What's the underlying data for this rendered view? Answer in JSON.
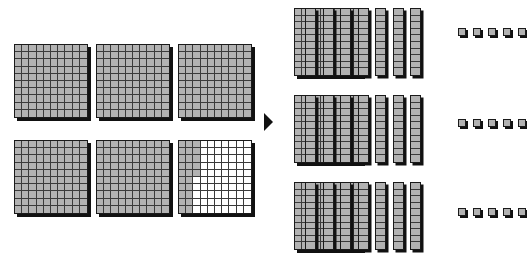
{
  "diagram": {
    "type": "base-ten-blocks-division",
    "colors": {
      "block_fill": "#b2b2b2",
      "block_outline": "#1a1a1a",
      "grid_line": "#3a3a3a",
      "shadow": "#111111",
      "background": "#ffffff",
      "arrow": "#111111"
    },
    "arrow": {
      "icon": "right-triangle-arrow-icon",
      "direction": "right",
      "label": ""
    },
    "left_side": {
      "caption": "",
      "total_value": 525,
      "flats": [
        {
          "index": 1,
          "rows": 10,
          "cols": 10,
          "shaded_cells": 100,
          "value": 100,
          "shading": "full"
        },
        {
          "index": 2,
          "rows": 10,
          "cols": 10,
          "shaded_cells": 100,
          "value": 100,
          "shading": "full"
        },
        {
          "index": 3,
          "rows": 10,
          "cols": 10,
          "shaded_cells": 100,
          "value": 100,
          "shading": "full"
        },
        {
          "index": 4,
          "rows": 10,
          "cols": 10,
          "shaded_cells": 100,
          "value": 100,
          "shading": "full"
        },
        {
          "index": 5,
          "rows": 10,
          "cols": 10,
          "shaded_cells": 100,
          "value": 100,
          "shading": "full"
        },
        {
          "index": 6,
          "rows": 10,
          "cols": 10,
          "shaded_cells": 25,
          "value": 25,
          "shading": "partial",
          "shaded_pattern": "left 2 columns plus 5 cells of third column"
        }
      ]
    },
    "right_side": {
      "caption": "",
      "group_count": 3,
      "group_value": 175,
      "total_value": 525,
      "groups": [
        {
          "index": 1,
          "flats": 1,
          "rods": 7,
          "units": 5,
          "value": 175
        },
        {
          "index": 2,
          "flats": 1,
          "rods": 7,
          "units": 5,
          "value": 175
        },
        {
          "index": 3,
          "flats": 1,
          "rods": 7,
          "units": 5,
          "value": 175
        }
      ],
      "piece_values": {
        "flat": 100,
        "rod": 10,
        "unit": 1
      }
    }
  }
}
